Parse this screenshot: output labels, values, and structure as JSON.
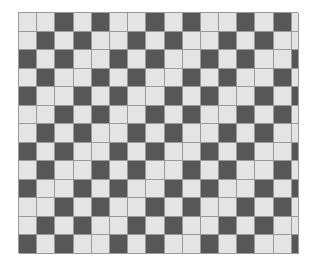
{
  "diagram": {
    "type": "weave-draft-grid",
    "rows": 13,
    "columns": 16,
    "last_column_partial": true,
    "colors": {
      "dark": "#575757",
      "light": "#e4e4e4",
      "grid_line": "#9a9a9a"
    },
    "pattern": [
      "LLDLDLLDLDLLDLDL",
      "LDLDLLDLDLLDLDLL",
      "DLDLLDLDLLDLDLLD",
      "LDLLDLDLLDLDLLDL",
      "DLLDLDLLDLDLLDLD",
      "LLDLDLLDLDLLDLDL",
      "LDLDLLDLDLLDLDLL",
      "DLDLLDLDLLDLDLLD",
      "LDLLDLDLLDLDLLDL",
      "DLLDLDLLDLDLLDLD",
      "LLDLDLLDLDLLDLDL",
      "LDLDLLDLDLLDLDLL",
      "DLDLLDLDLLDLDLLD"
    ]
  }
}
